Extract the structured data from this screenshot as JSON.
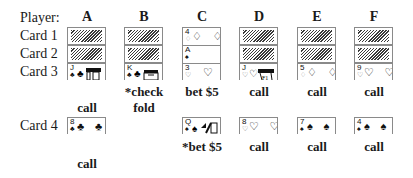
{
  "labels": {
    "player": "Player:",
    "card1": "Card 1",
    "card2": "Card 2",
    "card3": "Card 3",
    "card4": "Card 4"
  },
  "players": [
    {
      "name": "A",
      "card3": {
        "rank": "J",
        "suit": "♣",
        "face": true
      },
      "action3": [
        "",
        "call"
      ],
      "card4": {
        "rank": "8",
        "suit": "♣",
        "pips": "♣ ♣"
      },
      "action4": [
        "",
        "call"
      ]
    },
    {
      "name": "B",
      "card3": {
        "rank": "K",
        "suit": "♣",
        "face": true
      },
      "action3": [
        "*check",
        "fold"
      ],
      "card4": null,
      "action4": [
        "",
        ""
      ]
    },
    {
      "name": "C",
      "card1": {
        "rank": "4",
        "suit": "♢",
        "pips": "♢ ♢"
      },
      "card2": {
        "rank": "A",
        "suit": "♠"
      },
      "card3": {
        "rank": "3",
        "suit": "♡",
        "pips": "♡"
      },
      "action3": [
        "bet $5",
        ""
      ],
      "card4": {
        "rank": "Q",
        "suit": "♠",
        "face": true
      },
      "action4": [
        "*bet $5",
        ""
      ]
    },
    {
      "name": "D",
      "card3": {
        "rank": "J",
        "suit": "♡",
        "face": true
      },
      "action3": [
        "call",
        ""
      ],
      "card4": {
        "rank": "8",
        "suit": "♡",
        "pips": "♡ ♡"
      },
      "action4": [
        "call",
        ""
      ]
    },
    {
      "name": "E",
      "card3": {
        "rank": "5",
        "suit": "♢",
        "pips": "♢ ♢"
      },
      "action3": [
        "call",
        ""
      ],
      "card4": {
        "rank": "7",
        "suit": "♠",
        "pips": "♠ ♠"
      },
      "action4": [
        "call",
        ""
      ]
    },
    {
      "name": "F",
      "card3": {
        "rank": "9",
        "suit": "♡",
        "pips": "♡ ♡"
      },
      "action3": [
        "call",
        ""
      ],
      "card4": {
        "rank": "4",
        "suit": "♠",
        "pips": "♠ ♠"
      },
      "action4": [
        "call",
        ""
      ]
    }
  ],
  "face_down_icon": "hatched-card-back"
}
